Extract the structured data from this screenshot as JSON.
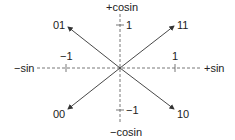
{
  "diagram": {
    "type": "constellation",
    "axes": {
      "vertical_top": "+cosin",
      "vertical_bottom": "−cosin",
      "horizontal_left": "−sin",
      "horizontal_right": "+sin"
    },
    "ticks": {
      "top": "1",
      "bottom": "−1",
      "left": "−1",
      "right": "1"
    },
    "points": [
      {
        "label": "01",
        "quadrant": "upper-left"
      },
      {
        "label": "11",
        "quadrant": "upper-right"
      },
      {
        "label": "00",
        "quadrant": "lower-left"
      },
      {
        "label": "10",
        "quadrant": "lower-right"
      }
    ],
    "colors": {
      "line": "#333333",
      "text": "#222222"
    }
  }
}
